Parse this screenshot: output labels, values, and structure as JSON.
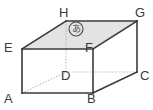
{
  "figure": {
    "name": "rectangular-prism-diagram",
    "shape_type": "rectangular prism",
    "background_color": "#ffffff",
    "edge_color": "#3a3a3a",
    "hidden_edge_color": "#b4b4b4",
    "top_face_fill": "#e3e3e3",
    "label_color": "#3a3a3a"
  },
  "vertices": [
    {
      "id": "A",
      "label": "A",
      "x": 22,
      "y": 93,
      "hidden": false,
      "label_x": 4,
      "label_y": 92
    },
    {
      "id": "B",
      "label": "B",
      "x": 93,
      "y": 93,
      "hidden": false,
      "label_x": 87,
      "label_y": 92
    },
    {
      "id": "C",
      "label": "C",
      "x": 137,
      "y": 72,
      "hidden": false,
      "label_x": 140,
      "label_y": 69
    },
    {
      "id": "D",
      "label": "D",
      "x": 66,
      "y": 72,
      "hidden": true,
      "label_x": 61,
      "label_y": 69
    },
    {
      "id": "E",
      "label": "E",
      "x": 22,
      "y": 49,
      "hidden": false,
      "label_x": 4,
      "label_y": 41
    },
    {
      "id": "F",
      "label": "F",
      "x": 93,
      "y": 49,
      "hidden": false,
      "label_x": 85,
      "label_y": 41
    },
    {
      "id": "G",
      "label": "G",
      "x": 137,
      "y": 21,
      "hidden": false,
      "label_x": 135,
      "label_y": 6
    },
    {
      "id": "H",
      "label": "H",
      "x": 66,
      "y": 21,
      "hidden": false,
      "label_x": 59,
      "label_y": 6
    }
  ],
  "faces": {
    "top_face": {
      "name": "top-face-EFGH",
      "points": "22,49 66,21 137,21 93,49",
      "shaded": true
    }
  },
  "edges": {
    "visible": [
      {
        "name": "edge-A-B",
        "points": "22,93 93,93"
      },
      {
        "name": "edge-B-F",
        "points": "93,93 93,49"
      },
      {
        "name": "edge-A-E",
        "points": "22,93 22,49"
      },
      {
        "name": "edge-E-F",
        "points": "22,49 93,49"
      },
      {
        "name": "edge-E-H",
        "points": "22,49 66,21"
      },
      {
        "name": "edge-H-G",
        "points": "66,21 137,21"
      },
      {
        "name": "edge-G-F",
        "points": "137,21 93,49"
      },
      {
        "name": "edge-G-C",
        "points": "137,21 137,72"
      },
      {
        "name": "edge-C-B",
        "points": "137,72 93,93"
      }
    ],
    "hidden": [
      {
        "name": "edge-A-D-hidden",
        "points": "22,93 66,72"
      },
      {
        "name": "edge-D-C-hidden",
        "points": "66,72 137,72"
      },
      {
        "name": "edge-D-H-hidden",
        "points": "66,72 66,21"
      }
    ]
  },
  "annotations": [
    {
      "name": "marked-face-annotation",
      "symbol": "あ",
      "circled": true,
      "x": 76,
      "y": 29,
      "radius": 7,
      "description": "circled hiragana a marking the top face"
    }
  ]
}
